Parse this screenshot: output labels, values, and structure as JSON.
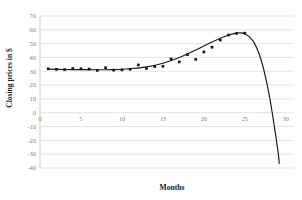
{
  "chart_data": {
    "type": "scatter",
    "title": "",
    "subtitle": "",
    "xlabel": "Months",
    "ylabel": "Closing prices in $",
    "xlim": [
      0,
      31
    ],
    "ylim": [
      -40,
      70
    ],
    "xticks": [
      0,
      5,
      10,
      15,
      20,
      25,
      30
    ],
    "yticks": [
      70,
      60,
      50,
      40,
      30,
      20,
      10,
      0,
      -10,
      -20,
      -30,
      -40
    ],
    "xtick_labels": [
      "0",
      "5",
      "10",
      "15",
      "20",
      "25",
      "30"
    ],
    "ytick_labels": [
      "70",
      "60",
      "50",
      "40",
      "30",
      "20",
      "10",
      "0",
      "-10",
      "-20",
      "-30",
      "-40"
    ],
    "grid": "horizontal",
    "legend": "none",
    "marker": "filled-square",
    "marker_color": "#111111",
    "trendline_color": "#1a1a1a",
    "gridline_color": "#d9d9d9",
    "background": "#ffffff",
    "series": [
      {
        "name": "Closing price observations",
        "marker_style": "scatter-points",
        "x": [
          1,
          2,
          3,
          4,
          5,
          6,
          7,
          8,
          9,
          10,
          11,
          12,
          13,
          14,
          15,
          16,
          17,
          18,
          19,
          20,
          21,
          22,
          23,
          24,
          25
        ],
        "y": [
          31.8,
          31.4,
          31.2,
          32.0,
          31.8,
          31.6,
          30.6,
          32.6,
          30.8,
          31.0,
          31.4,
          34.6,
          32.0,
          33.4,
          33.6,
          39.0,
          36.8,
          42.0,
          38.6,
          44.0,
          47.4,
          52.6,
          56.2,
          57.4,
          57.6
        ]
      },
      {
        "name": "Fitted polynomial trend",
        "marker_style": "line",
        "x": [
          1,
          3,
          5,
          7,
          9,
          11,
          13,
          15,
          17,
          19,
          21,
          23,
          24,
          25,
          26,
          27,
          28,
          29,
          29.2
        ],
        "y": [
          31.6,
          31.3,
          31.2,
          31.1,
          31.2,
          31.8,
          33.2,
          35.8,
          40.0,
          45.4,
          51.2,
          56.2,
          57.6,
          57.2,
          52.0,
          38.0,
          12.0,
          -26.0,
          -37.0
        ]
      }
    ],
    "annotations": []
  },
  "axis": {
    "y_title": "Closing prices in $",
    "x_title": "Months"
  }
}
